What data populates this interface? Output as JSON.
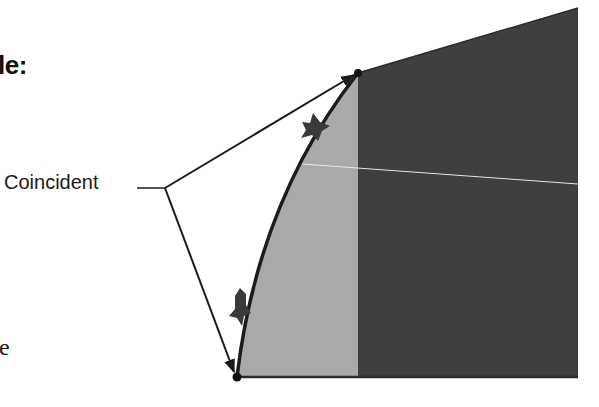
{
  "text": {
    "heading_fragment": "le:",
    "callout_label": "Coincident",
    "body_fragment": "e"
  },
  "diagram": {
    "colors": {
      "light_region": "#a9a9a9",
      "dark_region": "#3f3f3f",
      "outline": "#1c1c1c",
      "guide_line": "#e8e8e8",
      "marker": "#3a3a3a"
    },
    "points": {
      "top_vertex": [
        358,
        73
      ],
      "bottom_vertex": [
        237,
        377
      ],
      "callout_junction": [
        165,
        188
      ]
    },
    "markers": [
      {
        "name": "constraint-marker-upper",
        "position": [
          313,
          128
        ]
      },
      {
        "name": "constraint-marker-lower",
        "position": [
          240,
          312
        ]
      }
    ]
  }
}
